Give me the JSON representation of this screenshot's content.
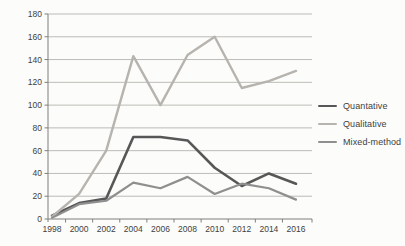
{
  "chart_data": {
    "type": "line",
    "title": "",
    "xlabel": "",
    "ylabel": "",
    "categories": [
      "1998",
      "2000",
      "2002",
      "2004",
      "2006",
      "2008",
      "2010",
      "2012",
      "2014",
      "2016"
    ],
    "series": [
      {
        "name": "Quantative",
        "color": "#575757",
        "line_width": 2.6,
        "values": [
          3,
          14,
          18,
          72,
          72,
          69,
          45,
          29,
          40,
          31
        ]
      },
      {
        "name": "Qualitative",
        "color": "#b7b4af",
        "line_width": 2.4,
        "values": [
          2,
          22,
          60,
          143,
          100,
          144,
          160,
          115,
          121,
          130
        ]
      },
      {
        "name": "Mixed-method",
        "color": "#8f8f8f",
        "line_width": 2.2,
        "values": [
          1,
          13,
          16,
          32,
          27,
          37,
          22,
          31,
          27,
          17
        ]
      }
    ],
    "ylim": [
      0,
      180
    ],
    "ytick_step": 20,
    "yticks": [
      "0",
      "20",
      "40",
      "60",
      "80",
      "100",
      "120",
      "140",
      "160",
      "180"
    ],
    "grid": true,
    "legend_position": "right"
  },
  "colors": {
    "background": "#fcfcfa",
    "gridline": "#a5a5a3",
    "axis_line": "#7f7f7d",
    "tick": "#7f7f7d",
    "axis_text": "#3f3f3f"
  },
  "legend": {
    "items": [
      {
        "label": "Quantative"
      },
      {
        "label": "Qualitative"
      },
      {
        "label": "Mixed-method"
      }
    ]
  }
}
